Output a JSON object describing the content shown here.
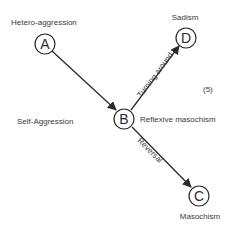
{
  "diagram": {
    "nodes": {
      "A": {
        "letter": "A",
        "label": "Hetero-aggression"
      },
      "B": {
        "letter": "B",
        "label": "Reflexive masochism"
      },
      "C": {
        "letter": "C",
        "label": "Masochism"
      },
      "D": {
        "letter": "D",
        "label": "Sadism"
      }
    },
    "side_label": "Self-Aggression",
    "figure_number": "(5)",
    "edges": [
      {
        "from": "A",
        "to": "B",
        "label": ""
      },
      {
        "from": "B",
        "to": "D",
        "label": "Turning around"
      },
      {
        "from": "B",
        "to": "C",
        "label": "Reversal"
      }
    ],
    "colors": {
      "line": "#2a2a2a",
      "text": "#3a3a3a",
      "background": "#ffffff"
    }
  }
}
